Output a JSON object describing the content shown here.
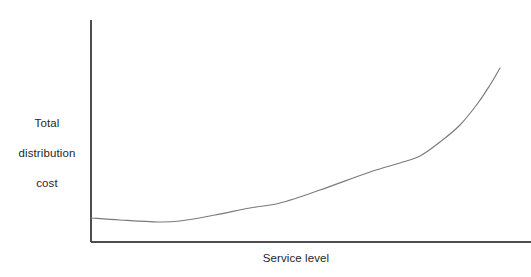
{
  "figure": {
    "width": 531,
    "height": 277,
    "background_color": "#ffffff"
  },
  "axis_label_y_line1": "Total",
  "axis_label_y_line2": "distribution",
  "axis_label_y_line3": "cost",
  "axis_label_x": "Service level",
  "chart_data": {
    "type": "line",
    "title": "",
    "subtitle": "",
    "xlabel": "Service level",
    "ylabel": "Total distribution cost",
    "legend": [],
    "legend_position": "none",
    "grid": false,
    "axis_ticks": false,
    "tick_labels_x": [],
    "tick_labels_y": [],
    "xlim": [
      0,
      100
    ],
    "ylim": [
      0,
      100
    ],
    "line_color": "#7a7a7a",
    "axis_color": "#4d4d4d",
    "annotations": [],
    "series": [
      {
        "name": "Total distribution cost",
        "x": [
          0,
          5,
          10,
          15,
          20,
          25,
          30,
          35,
          40,
          45,
          50,
          55,
          60,
          65,
          70,
          75,
          80,
          85,
          90,
          95,
          100
        ],
        "y": [
          10.7,
          9.8,
          9.2,
          9.0,
          9.1,
          9.6,
          10.4,
          11.5,
          12.9,
          14.6,
          16.7,
          19.2,
          22.2,
          25.8,
          30.2,
          35.6,
          42.2,
          50.4,
          60.6,
          72.9,
          87.4
        ]
      }
    ],
    "pixel_path": {
      "note": "Curve control points in screenshot pixel coordinates (x right, y down).",
      "points": [
        [
          91,
          218
        ],
        [
          120,
          220
        ],
        [
          158,
          222
        ],
        [
          180,
          221
        ],
        [
          215,
          215
        ],
        [
          250,
          208
        ],
        [
          280,
          203
        ],
        [
          320,
          190
        ],
        [
          370,
          172
        ],
        [
          400,
          163
        ],
        [
          420,
          156
        ],
        [
          440,
          142
        ],
        [
          460,
          125
        ],
        [
          478,
          103
        ],
        [
          490,
          85
        ],
        [
          500,
          68
        ]
      ]
    },
    "axes_pixels": {
      "y_axis_x": 91,
      "y_axis_top": 20,
      "y_axis_bottom": 242,
      "x_axis_y": 242,
      "x_axis_left": 91,
      "x_axis_right": 531
    }
  }
}
